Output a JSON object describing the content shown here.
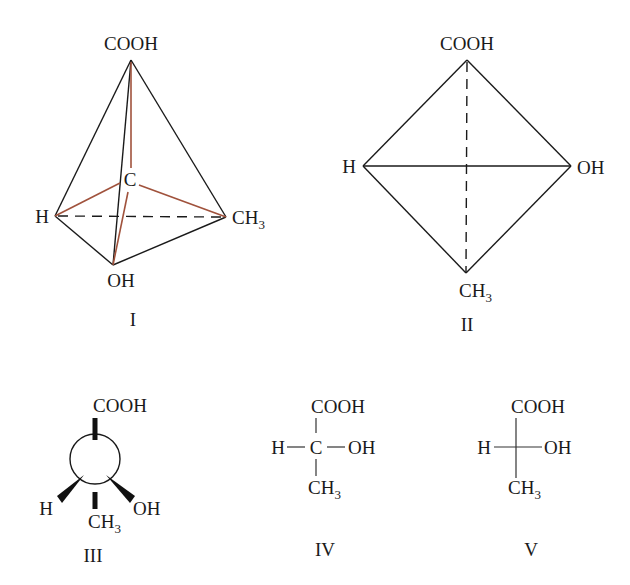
{
  "colors": {
    "ink": "#1a1a1a",
    "bond_to_center": "#a0523c",
    "background": "#ffffff"
  },
  "structures": [
    {
      "id": "I",
      "label": "I",
      "kind": "tetrahedron-3d",
      "center": "C",
      "top": "COOH",
      "left": "H",
      "right": "CH",
      "right_sub": "3",
      "bottom": "OH"
    },
    {
      "id": "II",
      "label": "II",
      "kind": "tetrahedron-projection",
      "top": "COOH",
      "left": "H",
      "right": "OH",
      "bottom": "CH",
      "bottom_sub": "3"
    },
    {
      "id": "III",
      "label": "III",
      "kind": "newman-like-wedge",
      "top": "COOH",
      "left": "H",
      "right": "OH",
      "bottom": "CH",
      "bottom_sub": "3"
    },
    {
      "id": "IV",
      "label": "IV",
      "kind": "structural-formula",
      "center": "C",
      "top": "COOH",
      "left": "H",
      "right": "OH",
      "bottom": "CH",
      "bottom_sub": "3"
    },
    {
      "id": "V",
      "label": "V",
      "kind": "fischer-projection",
      "top": "COOH",
      "left": "H",
      "right": "OH",
      "bottom": "CH",
      "bottom_sub": "3"
    }
  ]
}
